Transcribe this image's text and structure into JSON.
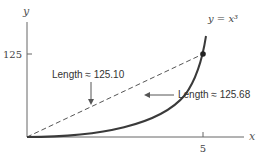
{
  "figure": {
    "y_axis_label": "y",
    "x_axis_label": "x",
    "y_tick_label": "125",
    "x_tick_label": "5",
    "curve_label": "y = x³",
    "chord_label": "Length ≈ 125.10",
    "arc_label": "Length ≈ 125.68"
  },
  "colors": {
    "axis": "#555555",
    "curve": "#3a3a3a",
    "chord": "#555555",
    "text": "#333333",
    "point": "#222222"
  }
}
